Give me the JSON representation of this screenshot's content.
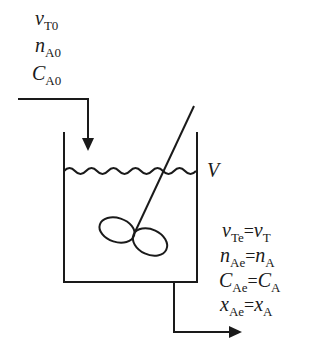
{
  "inlet": {
    "labels": [
      {
        "var": "v",
        "sub": "T0"
      },
      {
        "var": "n",
        "sub": "A0"
      },
      {
        "var": "C",
        "sub": "A0"
      }
    ]
  },
  "tank": {
    "volume_label": "V"
  },
  "outlet": {
    "equations": [
      {
        "lhs_var": "v",
        "lhs_sub": "Te",
        "op": "=",
        "rhs_var": "v",
        "rhs_sub": "T"
      },
      {
        "lhs_var": "n",
        "lhs_sub": "Ae",
        "op": "=",
        "rhs_var": "n",
        "rhs_sub": "A"
      },
      {
        "lhs_var": "C",
        "lhs_sub": "Ae",
        "op": "=",
        "rhs_var": "C",
        "rhs_sub": "A"
      },
      {
        "lhs_var": "x",
        "lhs_sub": "Ae",
        "op": "=",
        "rhs_var": "x",
        "rhs_sub": "A"
      }
    ]
  }
}
